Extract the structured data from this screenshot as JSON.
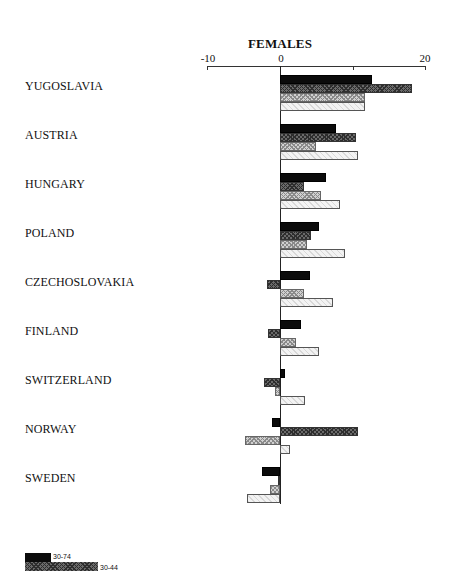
{
  "chart_data": {
    "type": "bar",
    "orientation": "horizontal",
    "title": "FEMALES",
    "xlabel": "",
    "ylabel": "",
    "xlim": [
      -10,
      20
    ],
    "xticks": [
      -10,
      0,
      10,
      20
    ],
    "xtick_labels": [
      "-10",
      "0",
      "",
      "20"
    ],
    "grid": false,
    "legend_position": "bottom-left",
    "categories": [
      "YUGOSLAVIA",
      "AUSTRIA",
      "HUNGARY",
      "POLAND",
      "CZECHOSLOVAKIA",
      "FINLAND",
      "SWITZERLAND",
      "NORWAY",
      "SWEDEN"
    ],
    "series": [
      {
        "name": "30-74",
        "pattern": "solid-black",
        "values": [
          12.6,
          7.7,
          6.3,
          5.3,
          4.1,
          2.9,
          0.7,
          -1.1,
          -2.5
        ]
      },
      {
        "name": "30-44",
        "pattern": "dark-hatch",
        "values": [
          18.2,
          10.4,
          3.3,
          4.3,
          -1.8,
          -1.6,
          -2.2,
          10.7,
          -0.3
        ]
      },
      {
        "name": "",
        "pattern": "light-hatch",
        "values": [
          11.7,
          4.9,
          5.7,
          3.7,
          3.3,
          2.2,
          -0.7,
          -4.8,
          -1.4
        ]
      },
      {
        "name": "",
        "pattern": "very-light-hatch",
        "values": [
          11.7,
          10.7,
          8.3,
          9.0,
          7.3,
          5.3,
          3.4,
          1.4,
          -4.5
        ]
      }
    ]
  },
  "legend": [
    {
      "label": "30-74",
      "pattern": "solid-black"
    },
    {
      "label": "30-44",
      "pattern": "dark-hatch"
    }
  ]
}
